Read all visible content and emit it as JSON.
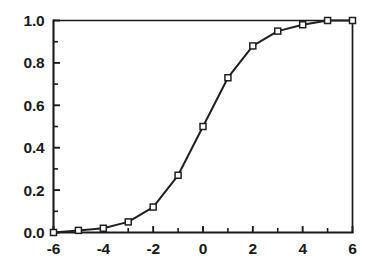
{
  "chart_data": {
    "type": "line",
    "title": "",
    "subtitle": "",
    "xlabel": "",
    "ylabel": "",
    "xlim": [
      -6,
      6
    ],
    "ylim": [
      0.0,
      1.0
    ],
    "grid": false,
    "legend": null,
    "marker": "open-square",
    "x_tick_labels": [
      "-6",
      "-4",
      "-2",
      "0",
      "2",
      "4",
      "6"
    ],
    "x_tick_values": [
      -6,
      -4,
      -2,
      0,
      2,
      4,
      6
    ],
    "x_minor_tick_values": [
      -5,
      -3,
      -1,
      1,
      3,
      5
    ],
    "y_tick_labels": [
      "0.0",
      "0.2",
      "0.4",
      "0.6",
      "0.8",
      "1.0"
    ],
    "y_tick_values": [
      0.0,
      0.2,
      0.4,
      0.6,
      0.8,
      1.0
    ],
    "y_minor_tick_values": [
      0.1,
      0.3,
      0.5,
      0.7,
      0.9
    ],
    "series": [
      {
        "name": "logistic",
        "x": [
          -6,
          -5,
          -4,
          -3,
          -2,
          -1,
          0,
          1,
          2,
          3,
          4,
          5,
          6
        ],
        "values": [
          0.0,
          0.01,
          0.02,
          0.05,
          0.12,
          0.27,
          0.5,
          0.73,
          0.88,
          0.95,
          0.98,
          1.0,
          1.0
        ]
      }
    ],
    "colors": {
      "line": "#1f1f1f",
      "marker_fill": "#ffffff",
      "marker_edge": "#1f1f1f",
      "axis": "#1a1a1a",
      "background": "#ffffff"
    }
  }
}
